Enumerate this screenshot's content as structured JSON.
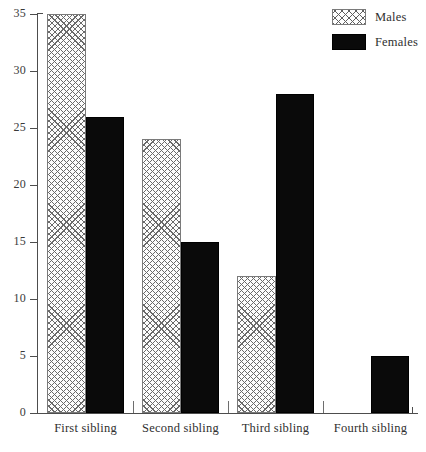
{
  "chart_data": {
    "type": "bar",
    "title": "",
    "subtitle": "",
    "xlabel": "",
    "ylabel": "",
    "categories": [
      "First sibling",
      "Second sibling",
      "Third sibling",
      "Fourth sibling"
    ],
    "series": [
      {
        "name": "Males",
        "values": [
          35,
          24,
          12,
          0
        ],
        "pattern": "cross-hatch",
        "color": "#fdfdfd"
      },
      {
        "name": "Females",
        "values": [
          26,
          15,
          28,
          5
        ],
        "pattern": "solid",
        "color": "#0a0a0a"
      }
    ],
    "ylim": [
      0,
      35
    ],
    "yticks": [
      0,
      5,
      10,
      15,
      20,
      25,
      30,
      35
    ],
    "ytick_labels": [
      "0",
      "5",
      "10",
      "15",
      "20",
      "25",
      "30",
      "35"
    ],
    "grid": false,
    "legend": {
      "position": "top-right",
      "entries": [
        {
          "label": "Males",
          "swatch": "males-hatch-swatch"
        },
        {
          "label": "Females",
          "swatch": "females-solid-swatch"
        }
      ]
    }
  }
}
